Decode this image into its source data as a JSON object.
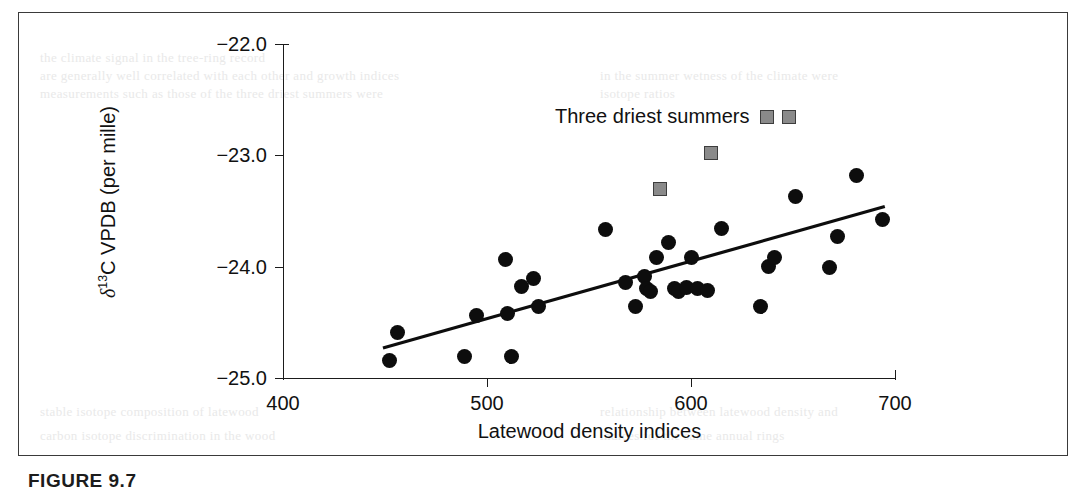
{
  "figure": {
    "caption": "FIGURE  9.7"
  },
  "legend": {
    "label": "Three driest summers",
    "marker": "gray-square"
  },
  "colors": {
    "point": "#0d0d0d",
    "highlight_fill": "#8a8a8a",
    "highlight_border": "#3d3d3d",
    "axis": "#1b1b1b",
    "frame": "#3a3a3a"
  },
  "bleed_text": [
    {
      "text": "the climate signal in the tree-ring record",
      "x": 40,
      "y": 50
    },
    {
      "text": "are generally well correlated with each other and growth indices",
      "x": 40,
      "y": 68
    },
    {
      "text": "in the summer wetness of the climate were",
      "x": 600,
      "y": 68
    },
    {
      "text": "measurements such as those of the three driest summers were",
      "x": 40,
      "y": 86
    },
    {
      "text": "isotope ratios",
      "x": 600,
      "y": 86
    },
    {
      "text": "stable isotope composition of latewood",
      "x": 40,
      "y": 404
    },
    {
      "text": "relationship between latewood density and",
      "x": 600,
      "y": 404
    },
    {
      "text": "carbon isotope discrimination in the wood",
      "x": 40,
      "y": 428
    },
    {
      "text": "indices for the same annual rings",
      "x": 600,
      "y": 428
    }
  ],
  "chart_data": {
    "type": "scatter",
    "title": "",
    "xlabel": "Latewood density indices",
    "ylabel": "δ¹³C VPDB (per mille)",
    "xlim": [
      400,
      700
    ],
    "ylim": [
      -25.0,
      -22.0
    ],
    "xticks": [
      400,
      500,
      600,
      700
    ],
    "yticks": [
      -22.0,
      -23.0,
      -24.0,
      -25.0
    ],
    "ytick_labels": [
      "−22.0",
      "−23.0",
      "−24.0",
      "−25.0"
    ],
    "xtick_labels": [
      "400",
      "500",
      "600",
      "700"
    ],
    "grid": false,
    "legend_position": "upper-center",
    "series": [
      {
        "name": "All summers",
        "marker": "filled-circle",
        "color": "#0d0d0d",
        "points": [
          [
            452,
            -24.84
          ],
          [
            456,
            -24.59
          ],
          [
            489,
            -24.81
          ],
          [
            495,
            -24.44
          ],
          [
            509,
            -23.94
          ],
          [
            510,
            -24.42
          ],
          [
            512,
            -24.81
          ],
          [
            517,
            -24.18
          ],
          [
            523,
            -24.11
          ],
          [
            525,
            -24.36
          ],
          [
            558,
            -23.67
          ],
          [
            568,
            -24.14
          ],
          [
            573,
            -24.36
          ],
          [
            577,
            -24.09
          ],
          [
            578,
            -24.2
          ],
          [
            580,
            -24.22
          ],
          [
            583,
            -23.92
          ],
          [
            589,
            -23.78
          ],
          [
            592,
            -24.2
          ],
          [
            594,
            -24.22
          ],
          [
            598,
            -24.19
          ],
          [
            600,
            -23.92
          ],
          [
            603,
            -24.2
          ],
          [
            608,
            -24.21
          ],
          [
            615,
            -23.66
          ],
          [
            634,
            -24.36
          ],
          [
            638,
            -24.0
          ],
          [
            641,
            -23.92
          ],
          [
            651,
            -23.37
          ],
          [
            668,
            -24.01
          ],
          [
            672,
            -23.73
          ],
          [
            681,
            -23.18
          ],
          [
            694,
            -23.58
          ]
        ]
      },
      {
        "name": "Three driest summers",
        "marker": "gray-square",
        "color": "#8a8a8a",
        "points": [
          [
            585,
            -23.3
          ],
          [
            610,
            -22.98
          ],
          [
            648,
            -22.66
          ]
        ]
      }
    ],
    "trendline": {
      "name": "linear fit",
      "x_start": 449,
      "y_start": -24.73,
      "x_end": 695,
      "y_end": -23.46
    }
  }
}
